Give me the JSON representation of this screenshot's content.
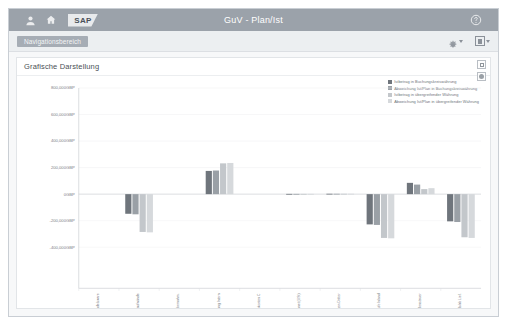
{
  "shell": {
    "title": "GuV - Plan/Ist",
    "icons": [
      {
        "name": "user-icon",
        "glyph": "person"
      },
      {
        "name": "home-icon",
        "glyph": "home"
      }
    ],
    "logo_text": "SAP",
    "help_icon": "help-icon"
  },
  "subbar": {
    "nav_tab_label": "Navigationsbereich",
    "settings_icon": "gear-icon",
    "settings_caret": "chevron-down-icon",
    "view_icon": "table-view-icon",
    "view_caret": "chevron-down-icon"
  },
  "panel": {
    "title": "Grafische Darstellung",
    "fullscreen_icon": "fullscreen-icon",
    "settings_icon": "settings-icon"
  },
  "legend": {
    "items": [
      {
        "label": "Istbetrag in Buchungskreiswährung",
        "color": "#6f757c"
      },
      {
        "label": "Abweichung Ist/Plan in Buchungskreiswährung",
        "color": "#9aa0a6"
      },
      {
        "label": "Istbetrag in übergreifender Währung",
        "color": "#c3c7cb"
      },
      {
        "label": "Abweichung Ist/Plan in übergreifender Währung",
        "color": "#d6d9dc"
      }
    ]
  },
  "chart_data": {
    "type": "bar",
    "title": "Grafische Darstellung",
    "xlabel": "",
    "ylabel": "",
    "currency": "GBP",
    "ylim": [
      -400000,
      800000
    ],
    "ytick_labels": [
      "800,000GBP",
      "600,000GBP",
      "400,000GBP",
      "200,000GBP",
      "0GBP",
      "-200,000GBP",
      "-400,000GBP"
    ],
    "ytick_values": [
      800000,
      600000,
      400000,
      200000,
      0,
      -200000,
      -400000
    ],
    "grid": true,
    "legend_position": "top-right",
    "categories": [
      "Handelsware",
      "Bestand Zwischenaufwände",
      "Bezahlt 1 Ste. Übernahm.",
      "Forderung Intern",
      "Nicht Saldokonten C",
      "Verrechnet (USt)",
      "Zinsaufwendungen Dritter",
      "Verkäufe Inland",
      "Quellensteuer",
      "VR Innerhalb/ab Lief."
    ],
    "series": [
      {
        "name": "Istbetrag in Buchungskreiswährung",
        "color": "#6f757c",
        "values": [
          0,
          -148000,
          0,
          175000,
          0,
          2000,
          3000,
          -228000,
          85000,
          -205000
        ]
      },
      {
        "name": "Abweichung Ist/Plan in Buchungskreiswährung",
        "color": "#9aa0a6",
        "values": [
          0,
          -152000,
          0,
          178000,
          0,
          2000,
          3000,
          -232000,
          72000,
          -210000
        ]
      },
      {
        "name": "Istbetrag in übergreifender Währung",
        "color": "#c3c7cb",
        "values": [
          0,
          -285000,
          0,
          232000,
          0,
          2000,
          3000,
          -330000,
          38000,
          -325000
        ]
      },
      {
        "name": "Abweichung Ist/Plan in übergreifender Währung",
        "color": "#d6d9dc",
        "values": [
          0,
          -288000,
          0,
          235000,
          0,
          2000,
          3000,
          -333000,
          45000,
          -330000
        ]
      }
    ]
  }
}
